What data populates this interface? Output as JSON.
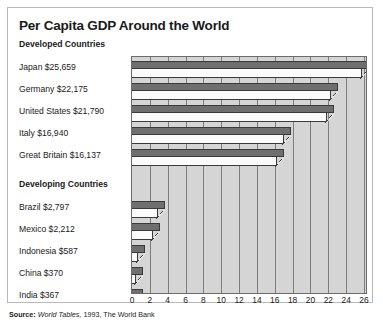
{
  "title": "Per Capita GDP Around the World",
  "groups": [
    {
      "heading": "Developed Countries"
    },
    {
      "heading": "Developing Countries"
    }
  ],
  "source": {
    "label": "Source:",
    "italic_part": "World Tables,",
    "rest": " 1993, The World Bank"
  },
  "chart_data": {
    "type": "bar",
    "orientation": "horizontal",
    "title": "Per Capita GDP Around the World",
    "xlabel": "",
    "ylabel": "",
    "xlim": [
      0,
      26
    ],
    "unit": "thousands of US dollars",
    "grid": true,
    "legend": "none",
    "tick_labels": [
      "0",
      "2",
      "4",
      "6",
      "8",
      "10",
      "12",
      "14",
      "16",
      "18",
      "20",
      "22",
      "24",
      "26"
    ],
    "tick_values": [
      0,
      2,
      4,
      6,
      8,
      10,
      12,
      14,
      16,
      18,
      20,
      22,
      24,
      26
    ],
    "groups": [
      {
        "name": "Developed Countries",
        "categories": [
          "Japan",
          "Germany",
          "United States",
          "Italy",
          "Great Britain"
        ],
        "labels": [
          "Japan $25,659",
          "Germany  $22,175",
          "United States  $21,790",
          "Italy  $16,940",
          "Great Britain  $16,137"
        ],
        "values": [
          25.659,
          22.175,
          21.79,
          16.94,
          16.137
        ]
      },
      {
        "name": "Developing Countries",
        "categories": [
          "Brazil",
          "Mexico",
          "Indonesia",
          "China",
          "India"
        ],
        "labels": [
          "Brazil $2,797",
          "Mexico $2,212",
          "Indonesia  $587",
          "China  $370",
          "India  $367"
        ],
        "values": [
          2.797,
          2.212,
          0.587,
          0.37,
          0.367
        ]
      }
    ],
    "colors": {
      "bar_top_face": "#6f6f6f",
      "bar_front_face": "#fbfbfb",
      "plot_background": "#d5d5d5",
      "gridline": "#7d7d7d",
      "outline": "#3a3a3a"
    }
  }
}
